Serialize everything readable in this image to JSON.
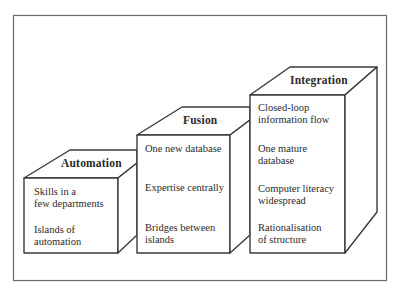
{
  "diagram": {
    "type": "staircase-of-3d-boxes",
    "stages": [
      {
        "id": "automation",
        "title": "Automation",
        "items": [
          "Skills in a\nfew departments",
          "Islands of\nautomation"
        ]
      },
      {
        "id": "fusion",
        "title": "Fusion",
        "items": [
          "One new database",
          "Expertise centrally",
          "Bridges between\nislands"
        ]
      },
      {
        "id": "integration",
        "title": "Integration",
        "items": [
          "Closed-loop\ninformation flow",
          "One mature\ndatabase",
          "Computer literacy\nwidespread",
          "Rationalisation\nof structure"
        ]
      }
    ],
    "colors": {
      "line": "#3a3a3a",
      "frame": "#6a6a6a",
      "background": "#ffffff"
    }
  }
}
